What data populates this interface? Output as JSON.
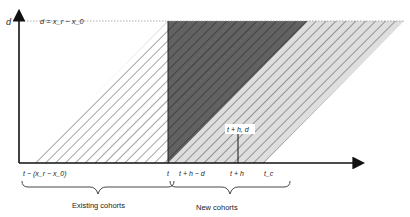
{
  "diagram": {
    "type": "lexis-diagram",
    "axes": {
      "y_label": "d",
      "top_line_label": "d = x_r − x_0"
    },
    "x_ticks": [
      {
        "id": "start",
        "label": "t − (x_r − x_0)"
      },
      {
        "id": "t",
        "label": "t"
      },
      {
        "id": "thd",
        "label": "t + h − d"
      },
      {
        "id": "th",
        "label": "t + h"
      },
      {
        "id": "tc",
        "label": "t_c"
      }
    ],
    "point_label": "t + h, d",
    "braces": [
      {
        "id": "existing",
        "label": "Existing cohorts"
      },
      {
        "id": "new",
        "label": "New cohorts"
      }
    ],
    "regions": [
      {
        "id": "existing-cohorts-region",
        "fill": "#ffffff",
        "hatch": "#555555"
      },
      {
        "id": "dark-triangle-region",
        "fill": "#5e5e5e",
        "hatch": "#2a2a2a"
      },
      {
        "id": "light-region",
        "fill": "#dcdcdc",
        "hatch": "#555555"
      }
    ]
  }
}
